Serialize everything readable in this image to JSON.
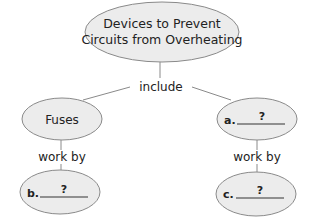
{
  "diagram": {
    "type": "concept-map",
    "root": {
      "line1": "Devices to Prevent",
      "line2": "Circuits from Overheating"
    },
    "links": {
      "include": "include",
      "work_by_left": "work by",
      "work_by_right": "work by"
    },
    "nodes": {
      "fuses": "Fuses",
      "a": {
        "label": "a.",
        "blank": "?"
      },
      "b": {
        "label": "b.",
        "blank": "?"
      },
      "c": {
        "label": "c.",
        "blank": "?"
      }
    }
  }
}
